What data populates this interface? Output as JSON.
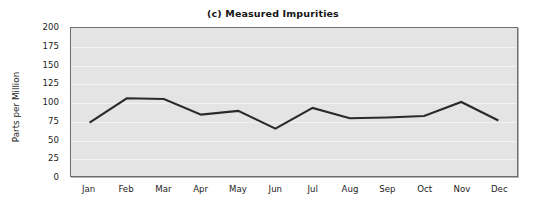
{
  "chart_data": {
    "type": "line",
    "title": "(c) Measured Impurities",
    "xlabel": "",
    "ylabel": "Parts per Million",
    "categories": [
      "Jan",
      "Feb",
      "Mar",
      "Apr",
      "May",
      "Jun",
      "Jul",
      "Aug",
      "Sep",
      "Oct",
      "Nov",
      "Dec"
    ],
    "values": [
      72,
      105,
      104,
      83,
      88,
      64,
      92,
      78,
      79,
      81,
      100,
      75
    ],
    "series": [
      {
        "name": "Measured Impurities",
        "values": [
          72,
          105,
          104,
          83,
          88,
          64,
          92,
          78,
          79,
          81,
          100,
          75
        ]
      }
    ],
    "ylim": [
      0,
      200
    ],
    "yticks": [
      0,
      25,
      50,
      75,
      100,
      125,
      150,
      175,
      200
    ],
    "ytick_labels": [
      "0",
      "25",
      "50",
      "75",
      "100",
      "125",
      "150",
      "175",
      "200"
    ],
    "grid": true,
    "grid_axis": "y",
    "legend": false,
    "legend_position": "none",
    "markers": false,
    "colors": {
      "line": "#2a2a2a",
      "plot_background": "#e4e4e4",
      "gridline": "#f3f3f3",
      "plot_border": "#6f6f6f",
      "text": "#1d1d1d",
      "title_text": "#161616",
      "figure_background": "#ffffff"
    },
    "line_width": 2.1
  }
}
